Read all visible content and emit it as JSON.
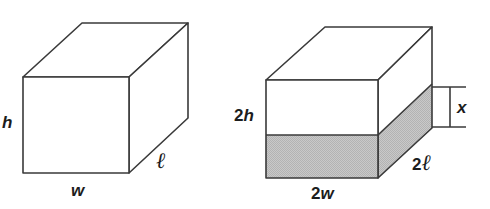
{
  "figure": {
    "background_color": "#ffffff",
    "line_color": "#3a3a3a",
    "shade_color": "#c4c4c4",
    "face_color": "#ffffff",
    "labels": {
      "h": "h",
      "w": "w",
      "l": "ℓ",
      "two_h_num": "2",
      "two_h_var": "h",
      "two_w_num": "2",
      "two_w_var": "w",
      "two_l_num": "2",
      "two_l_var": "ℓ",
      "x": "x"
    },
    "left_prism": {
      "name": "small-prism",
      "dimension_labels": [
        "h",
        "w",
        "ℓ"
      ],
      "shaded": false,
      "geometry": {
        "front_face": [
          [
            23,
            77
          ],
          [
            129,
            77
          ],
          [
            129,
            173
          ],
          [
            23,
            173
          ]
        ],
        "top_face": [
          [
            23,
            77
          ],
          [
            82,
            23
          ],
          [
            188,
            23
          ],
          [
            129,
            77
          ]
        ],
        "right_face": [
          [
            129,
            77
          ],
          [
            188,
            23
          ],
          [
            188,
            118
          ],
          [
            129,
            173
          ]
        ]
      }
    },
    "right_prism": {
      "name": "large-prism",
      "dimension_labels": [
        "2h",
        "2w",
        "2ℓ",
        "x"
      ],
      "shaded": true,
      "shaded_band_label": "x",
      "geometry": {
        "front_face": [
          [
            266,
            80
          ],
          [
            378,
            80
          ],
          [
            378,
            178
          ],
          [
            266,
            178
          ]
        ],
        "top_face": [
          [
            266,
            80
          ],
          [
            325,
            27
          ],
          [
            432,
            27
          ],
          [
            378,
            80
          ]
        ],
        "right_face": [
          [
            378,
            80
          ],
          [
            432,
            27
          ],
          [
            432,
            128
          ],
          [
            378,
            178
          ]
        ],
        "shade_front": [
          [
            266,
            135
          ],
          [
            378,
            135
          ],
          [
            378,
            178
          ],
          [
            266,
            178
          ]
        ],
        "shade_right": [
          [
            378,
            135
          ],
          [
            432,
            84
          ],
          [
            432,
            128
          ],
          [
            378,
            178
          ]
        ]
      },
      "dimension_bracket": {
        "name": "x-dimension-bracket",
        "top_y": 87,
        "bottom_y": 127,
        "line_x": 450,
        "extent_x_start": 432,
        "extent_x_end": 466
      }
    }
  }
}
